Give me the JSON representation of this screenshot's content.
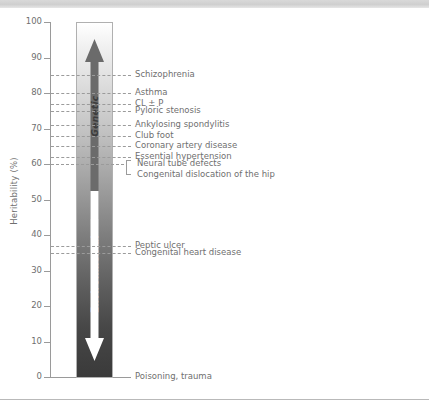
{
  "chart_data": {
    "type": "bar",
    "title": "",
    "subtitle": "",
    "xlabel": "",
    "ylabel": "Heritability (%)",
    "ylim": [
      0,
      100
    ],
    "grid": false,
    "legend_position": "none",
    "bar": {
      "top_label": "Genetic",
      "bottom_label": "Environmental",
      "top_value": 100,
      "bottom_value": 0,
      "gradient": "white (genetic, top) to dark grey (environmental, bottom)"
    },
    "categories": [
      "Schizophrenia",
      "Asthma",
      "CL ± P",
      "Pyloric stenosis",
      "Ankylosing spondylitis",
      "Club foot",
      "Coronary artery disease",
      "Essential hypertension",
      "Neural tube defects",
      "Congenital dislocation of the hip",
      "Peptic ulcer",
      "Congenital heart disease",
      "Poisoning, trauma"
    ],
    "values": [
      85,
      80,
      77,
      75,
      71,
      68,
      65,
      62,
      60,
      60,
      37,
      35,
      0
    ],
    "annotations": [
      {
        "label": "Schizophrenia",
        "value": 85,
        "style": "dashed"
      },
      {
        "label": "Asthma",
        "value": 80,
        "style": "dashed"
      },
      {
        "label": "CL ± P",
        "value": 77,
        "style": "dashed"
      },
      {
        "label": "Pyloric stenosis",
        "value": 75,
        "style": "dashed"
      },
      {
        "label": "Ankylosing spondylitis",
        "value": 71,
        "style": "dashed"
      },
      {
        "label": "Club foot",
        "value": 68,
        "style": "dashed"
      },
      {
        "label": "Coronary artery disease",
        "value": 65,
        "style": "dashed"
      },
      {
        "label": "Essential hypertension",
        "value": 62,
        "style": "dashed"
      },
      {
        "label": "Neural tube defects",
        "value": 60,
        "style": "bracket"
      },
      {
        "label": "Congenital dislocation of the hip",
        "value": 60,
        "style": "bracket"
      },
      {
        "label": "Peptic ulcer",
        "value": 37,
        "style": "dashed"
      },
      {
        "label": "Congenital heart disease",
        "value": 35,
        "style": "dashed"
      },
      {
        "label": "Poisoning, trauma",
        "value": 0,
        "style": "solid"
      }
    ],
    "yticks": [
      0,
      10,
      20,
      30,
      40,
      50,
      60,
      70,
      80,
      90,
      100
    ],
    "ytick_labels": [
      "0",
      "10",
      "20",
      "30",
      "40",
      "50",
      "60",
      "70",
      "80",
      "90",
      "100"
    ]
  },
  "axis": {
    "y_title": "Heritability (%)",
    "ticks": [
      {
        "label": "100",
        "value": 100
      },
      {
        "label": "90",
        "value": 90
      },
      {
        "label": "80",
        "value": 80
      },
      {
        "label": "70",
        "value": 70
      },
      {
        "label": "60",
        "value": 60
      },
      {
        "label": "50",
        "value": 50
      },
      {
        "label": "40",
        "value": 40
      },
      {
        "label": "30",
        "value": 30
      },
      {
        "label": "20",
        "value": 20
      },
      {
        "label": "10",
        "value": 10
      },
      {
        "label": "0",
        "value": 0
      }
    ]
  },
  "bar": {
    "genetic_label": "Genetic",
    "environmental_label": "Environmental"
  },
  "labels": [
    {
      "text": "Schizophrenia",
      "value": 85
    },
    {
      "text": "Asthma",
      "value": 80
    },
    {
      "text": "CL ± P",
      "value": 77
    },
    {
      "text": "Pyloric stenosis",
      "value": 75
    },
    {
      "text": "Ankylosing spondylitis",
      "value": 71
    },
    {
      "text": "Club foot",
      "value": 68
    },
    {
      "text": "Coronary artery disease",
      "value": 65
    },
    {
      "text": "Essential hypertension",
      "value": 62
    },
    {
      "text": "Neural tube defects",
      "value": 60
    },
    {
      "text": "Congenital dislocation of the hip",
      "value": 60
    },
    {
      "text": "Peptic ulcer",
      "value": 37
    },
    {
      "text": "Congenital heart disease",
      "value": 35
    },
    {
      "text": "Poisoning, trauma",
      "value": 0
    }
  ],
  "colors": {
    "axis": "#9a9a9a",
    "text": "#6f6f6f",
    "leader": "#9b9b9b",
    "bar_top": "#ffffff",
    "bar_bottom": "#3a3a3a",
    "genetic_text": "#3c3c3c",
    "environmental_text": "#ffffff",
    "top_band": "#d4d4d4"
  }
}
